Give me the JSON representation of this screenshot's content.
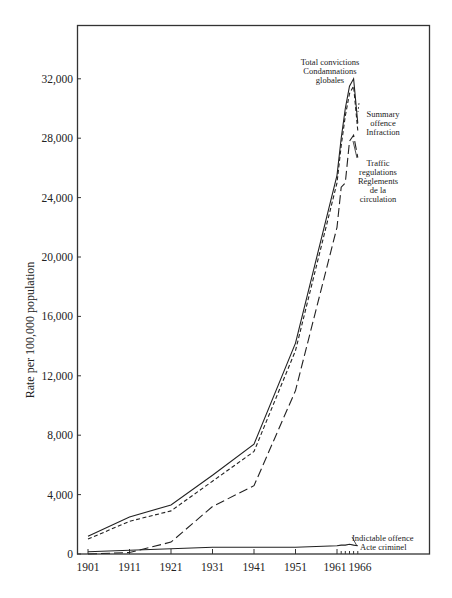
{
  "chart_data": {
    "type": "line",
    "title": "",
    "xlabel": "",
    "ylabel": "Rate per 100,000 population",
    "ylim": [
      0,
      35500
    ],
    "xlim": [
      1900,
      1966
    ],
    "grid": false,
    "legend_position": "inline annotations",
    "x_ticks": [
      "1901",
      "1911",
      "1921",
      "1931",
      "1941",
      "1951",
      "1961",
      "1966"
    ],
    "y_ticks": [
      "0",
      "4,000",
      "8,000",
      "12,000",
      "16,000",
      "20,000",
      "24,000",
      "28,000",
      "32,000"
    ],
    "x": [
      1901,
      1911,
      1921,
      1931,
      1941,
      1951,
      1961,
      1962,
      1963,
      1964,
      1965,
      1966
    ],
    "series": [
      {
        "name": "Total convictions / Condamnations globales",
        "style": "solid",
        "values": [
          1200,
          2500,
          3300,
          5300,
          7400,
          14200,
          25500,
          28000,
          30000,
          31500,
          32000,
          29000
        ]
      },
      {
        "name": "Summary offence / Infraction",
        "style": "short-dash",
        "values": [
          1000,
          2200,
          2900,
          4900,
          6900,
          13700,
          25000,
          27500,
          29500,
          31000,
          31500,
          28500
        ]
      },
      {
        "name": "Traffic regulations / Règlements de la circulation",
        "style": "long-dash",
        "values": [
          0,
          100,
          800,
          3200,
          4600,
          11000,
          22000,
          24700,
          25000,
          27800,
          28200,
          26700
        ]
      },
      {
        "name": "Indictable offence / Acte criminel",
        "style": "solid",
        "values": [
          150,
          250,
          350,
          450,
          450,
          450,
          550,
          600,
          600,
          650,
          600,
          550
        ]
      }
    ],
    "annotations": [
      {
        "lines": [
          "Total convictions",
          "Condamnations",
          "globales"
        ]
      },
      {
        "lines": [
          "Summary",
          "offence",
          "Infraction"
        ]
      },
      {
        "lines": [
          "Traffic",
          "regulations",
          "Règlements",
          "de la",
          "circulation"
        ]
      },
      {
        "lines": [
          "Indictable offence",
          "Acte criminel"
        ]
      }
    ]
  },
  "labels": {
    "ylabel": "Rate per 100,000 population",
    "yticks": {
      "t0": "0",
      "t1": "4,000",
      "t2": "8,000",
      "t3": "12,000",
      "t4": "16,000",
      "t5": "20,000",
      "t6": "24,000",
      "t7": "28,000",
      "t8": "32,000"
    },
    "xticks": {
      "t1901": "1901",
      "t1911": "1911",
      "t1921": "1921",
      "t1931": "1931",
      "t1941": "1941",
      "t1951": "1951",
      "t1961": "1961",
      "t1966": "1966"
    },
    "total": {
      "l1": "Total convictions",
      "l2": "Condamnations",
      "l3": "globales"
    },
    "summary": {
      "l1": "Summary",
      "l2": "offence",
      "l3": "Infraction"
    },
    "traffic": {
      "l1": "Traffic",
      "l2": "regulations",
      "l3": "Règlements",
      "l4": "de la",
      "l5": "circulation"
    },
    "indictable": {
      "l1": "Indictable offence",
      "l2": "Acte criminel"
    }
  }
}
